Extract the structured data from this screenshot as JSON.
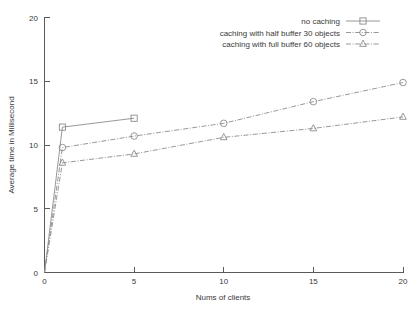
{
  "chart_data": {
    "type": "line",
    "title": "",
    "xlabel": "Nums of clients",
    "ylabel": "Average time in Millisecond",
    "xlim": [
      0,
      20
    ],
    "ylim": [
      0,
      20
    ],
    "xticks": [
      "0",
      "5",
      "10",
      "15",
      "20"
    ],
    "yticks": [
      "0",
      "5",
      "10",
      "15",
      "20"
    ],
    "xtick_values": [
      0,
      5,
      10,
      15,
      20
    ],
    "ytick_values": [
      0,
      5,
      10,
      15,
      20
    ],
    "grid": false,
    "legend_position": "top-right",
    "series": [
      {
        "name": "no caching",
        "marker": "square",
        "linestyle": "solid",
        "color": "#8c8c8c",
        "x": [
          0,
          1,
          5
        ],
        "values": [
          0,
          11.4,
          12.1
        ]
      },
      {
        "name": "caching with half buffer 30 objects",
        "marker": "circle",
        "linestyle": "dashdot",
        "color": "#8c8c8c",
        "x": [
          0,
          1,
          5,
          10,
          15,
          20
        ],
        "values": [
          0,
          9.8,
          10.7,
          11.7,
          13.4,
          14.9
        ]
      },
      {
        "name": "caching with full buffer 60 objects",
        "marker": "triangle",
        "linestyle": "dashdot",
        "color": "#8c8c8c",
        "x": [
          0,
          1,
          5,
          10,
          15,
          20
        ],
        "values": [
          0,
          8.6,
          9.3,
          10.6,
          11.3,
          12.2
        ]
      }
    ]
  },
  "legend": {
    "entries": [
      {
        "label": "no caching",
        "marker": "square-marker-icon"
      },
      {
        "label": "caching with half buffer 30 objects",
        "marker": "circle-marker-icon"
      },
      {
        "label": "caching with full buffer 60 objects",
        "marker": "triangle-marker-icon"
      }
    ]
  },
  "axes": {
    "x_title": "Nums of clients",
    "y_title": "Average time in Millisecond",
    "x_tick_labels": [
      "0",
      "5",
      "10",
      "15",
      "20"
    ],
    "y_tick_labels": [
      "0",
      "5",
      "10",
      "15",
      "20"
    ]
  },
  "colors": {
    "line": "#8c8c8c",
    "axis": "#5a5a5a",
    "text": "#3a3a3a",
    "background": "#ffffff"
  }
}
